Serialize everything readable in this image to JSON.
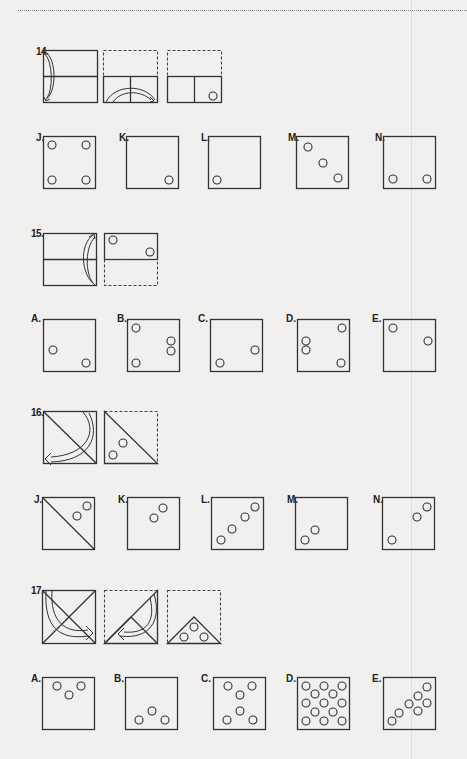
{
  "page": {
    "type": "paper-folding-test",
    "questions": [
      {
        "number": "14.",
        "steps": [
          "fold top half down (arc arrow)",
          "fold left half over right (arc arrow)",
          "hole punched bottom-right"
        ],
        "options": [
          {
            "label": "J.",
            "holes": "four holes, one in each corner"
          },
          {
            "label": "K.",
            "holes": "one hole bottom-right"
          },
          {
            "label": "L.",
            "holes": "one hole bottom-left"
          },
          {
            "label": "M.",
            "holes": "three holes diagonal top-left to bottom-right"
          },
          {
            "label": "N.",
            "holes": "two holes bottom-left and bottom-right"
          }
        ]
      },
      {
        "number": "15.",
        "steps": [
          "fold bottom half up (arc arrow)",
          "holes punched top-left and right-middle"
        ],
        "options": [
          {
            "label": "A.",
            "holes": "two holes: left-middle, bottom-right"
          },
          {
            "label": "B.",
            "holes": "four holes: top-left, right-middle, right-lower, bottom-left"
          },
          {
            "label": "C.",
            "holes": "two holes: bottom-left, right-middle"
          },
          {
            "label": "D.",
            "holes": "three holes: top-right, left-middle, bottom-left... and bottom-right"
          },
          {
            "label": "E.",
            "holes": "two holes: top-left, right-middle"
          }
        ]
      },
      {
        "number": "16.",
        "steps": [
          "fold along diagonal (arc arrow)",
          "two holes punched in lower-left triangle"
        ],
        "options": [
          {
            "label": "J.",
            "holes": "diagonal line with two holes upper-right"
          },
          {
            "label": "K.",
            "holes": "two holes diagonal center"
          },
          {
            "label": "L.",
            "holes": "four holes along diagonal"
          },
          {
            "label": "M.",
            "holes": "two holes lower-left"
          },
          {
            "label": "N.",
            "holes": "three holes: two upper-right, one lower-left"
          }
        ]
      },
      {
        "number": "17.",
        "steps": [
          "fold along diagonal (arc arrow)",
          "fold along other diagonal (arc arrow)",
          "three holes punched in bottom triangle"
        ],
        "options": [
          {
            "label": "A.",
            "holes": "three holes clustered top"
          },
          {
            "label": "B.",
            "holes": "three holes clustered bottom"
          },
          {
            "label": "C.",
            "holes": "six holes top and bottom"
          },
          {
            "label": "D.",
            "holes": "twelve holes filling square"
          },
          {
            "label": "E.",
            "holes": "six holes along diagonal"
          }
        ]
      }
    ]
  }
}
